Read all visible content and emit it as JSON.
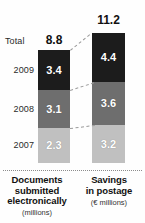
{
  "chart_data": {
    "type": "bar",
    "title": "",
    "subtitle": "",
    "xlabel": "",
    "ylabel": "",
    "stacked": true,
    "grid": false,
    "legend_position": "none",
    "categories": [
      "Documents submitted electronically",
      "Savings in postage"
    ],
    "category_units": [
      "(millions)",
      "(€ millions)"
    ],
    "series": [
      {
        "name": "2009",
        "values": [
          3.4,
          4.4
        ],
        "color": "#1c1c1c"
      },
      {
        "name": "2008",
        "values": [
          3.1,
          3.6
        ],
        "color": "#6e6e6e"
      },
      {
        "name": "2007",
        "values": [
          2.3,
          3.2
        ],
        "color": "#c0c0c0"
      }
    ],
    "totals": [
      8.8,
      11.2
    ],
    "total_label": "Total",
    "annotations": [
      "dashed connectors link matching year segments across the two columns"
    ]
  },
  "labels": {
    "total_word": "Total",
    "total_left": "8.8",
    "total_right": "11.2",
    "year_2009": "2009",
    "year_2008": "2008",
    "year_2007": "2007"
  },
  "bar_left": {
    "seg_2009": "3.4",
    "seg_2008": "3.1",
    "seg_2007": "2.3"
  },
  "bar_right": {
    "seg_2009": "4.4",
    "seg_2008": "3.6",
    "seg_2007": "3.2"
  },
  "captions": {
    "left_line1": "Documents",
    "left_line2": "submitted",
    "left_line3": "electronically",
    "left_unit": "(millions)",
    "right_line1": "Savings",
    "right_line2": "in postage",
    "right_unit": "(€ millions)"
  },
  "colors": {
    "dark": "#1c1c1c",
    "medium": "#6e6e6e",
    "light": "#c0c0c0",
    "background": "#fefefe",
    "text": "#111111",
    "connector": "#9a9a9a"
  }
}
